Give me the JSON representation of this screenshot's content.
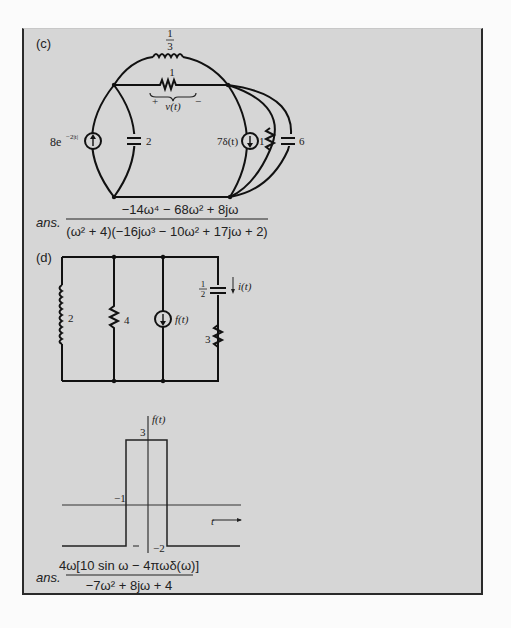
{
  "part_c": {
    "label": "(c)",
    "components": {
      "inductor_top": "1/3",
      "inductor_top_num": "1",
      "inductor_top_den": "3",
      "resistor_top": "1",
      "voltage_label": "v(t)",
      "voltage_plus": "+",
      "voltage_minus": "−",
      "source_left": "8e",
      "source_left_exp": "−2|t|",
      "capacitor_left": "2",
      "source_right": "7δ(t)",
      "resistor_right": "1",
      "capacitor_right": "6"
    },
    "answer": {
      "prefix": "ans.",
      "numerator": "−14ω⁴ − 68ω² + 8jω",
      "denominator": "(ω² + 4)(−16jω³ − 10ω² + 17jω + 2)"
    }
  },
  "part_d": {
    "label": "(d)",
    "components": {
      "inductor_left": "2",
      "resistor_mid": "4",
      "source": "f(t)",
      "capacitor_num": "1",
      "capacitor_den": "2",
      "current_label": "i(t)",
      "resistor_right": "3"
    },
    "graph": {
      "y_label": "f(t)",
      "x_label": "t",
      "tick_top": "3",
      "tick_mid": "−1",
      "tick_bottom_left": "−1",
      "tick_bottom_right": "−2"
    },
    "answer": {
      "prefix": "ans.",
      "numerator": "4ω[10 sin ω − 4πωδ(ω)]",
      "denominator": "−7ω² + 8jω + 4"
    }
  }
}
